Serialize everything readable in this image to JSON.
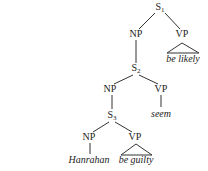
{
  "tree": {
    "s1": {
      "label": "S",
      "sub": "1"
    },
    "s1_np": {
      "label": "NP"
    },
    "s1_vp": {
      "label": "VP",
      "leaf": "be likely"
    },
    "s2": {
      "label": "S",
      "sub": "2"
    },
    "s2_np": {
      "label": "NP"
    },
    "s2_vp": {
      "label": "VP",
      "leaf": "seem"
    },
    "s3": {
      "label": "S",
      "sub": "3"
    },
    "s3_np": {
      "label": "NP",
      "leaf": "Hanrahan"
    },
    "s3_vp": {
      "label": "VP",
      "leaf": "be guilty"
    }
  },
  "colors": {
    "line": "#333333",
    "text": "#222222",
    "background": "#ffffff"
  }
}
